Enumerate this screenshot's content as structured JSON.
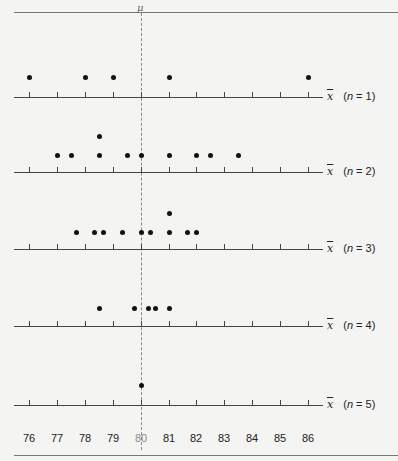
{
  "chart_data": {
    "type": "scatter",
    "xlabel": "x̄",
    "xlim": [
      76,
      86
    ],
    "x_ticks": [
      76,
      77,
      78,
      79,
      80,
      81,
      82,
      83,
      84,
      85,
      86
    ],
    "mean_marker": {
      "label": "μ",
      "value": 80
    },
    "series": [
      {
        "name": "n = 1",
        "values": [
          76,
          78,
          79,
          81,
          86
        ]
      },
      {
        "name": "n = 2",
        "values": [
          77,
          77.5,
          78.5,
          78.5,
          79.5,
          80,
          81,
          82,
          82.5,
          83.5
        ]
      },
      {
        "name": "n = 3",
        "values": [
          77.67,
          78.33,
          78.67,
          79.33,
          80,
          80.33,
          81,
          81,
          81.67,
          82
        ]
      },
      {
        "name": "n = 4",
        "values": [
          78.5,
          79.75,
          80.25,
          80.5,
          81
        ]
      },
      {
        "name": "n = 5",
        "values": [
          80
        ]
      }
    ]
  },
  "labels": {
    "mu": "μ",
    "xbar": "x",
    "rows": [
      {
        "n": "n",
        "eq": " = 1"
      },
      {
        "n": "n",
        "eq": " = 2"
      },
      {
        "n": "n",
        "eq": " = 3"
      },
      {
        "n": "n",
        "eq": " = 4"
      },
      {
        "n": "n",
        "eq": " = 5"
      }
    ],
    "ticks": [
      "76",
      "77",
      "78",
      "79",
      "80",
      "81",
      "82",
      "83",
      "84",
      "85",
      "86"
    ]
  }
}
